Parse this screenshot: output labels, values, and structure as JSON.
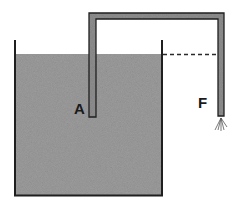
{
  "diagram": {
    "type": "siphon",
    "labels": {
      "a": "A",
      "f": "F"
    },
    "colors": {
      "water": "#9a9a9a",
      "tube_fill": "#8c8c8c",
      "outline": "#1f1f1f",
      "background": "#ffffff"
    },
    "elements": [
      "container",
      "liquid",
      "siphon-tube",
      "water-level-dashed-line",
      "outflow-spray"
    ]
  }
}
